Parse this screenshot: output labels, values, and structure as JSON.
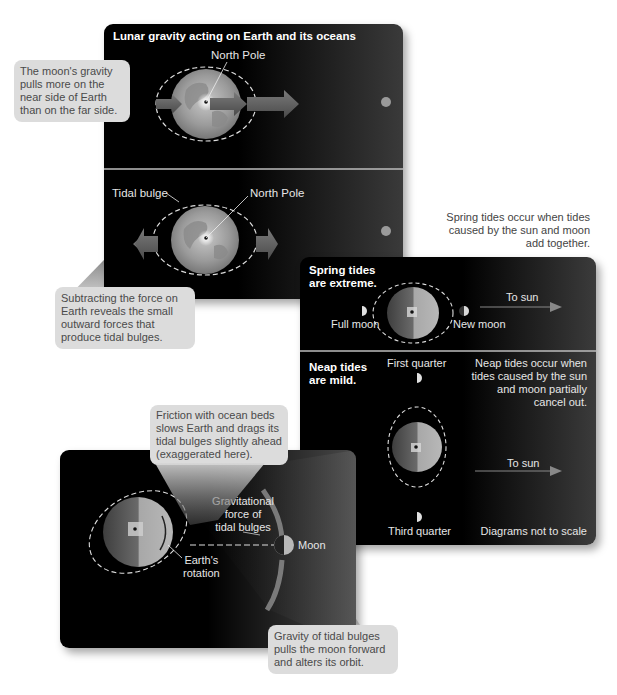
{
  "figure": {
    "top_panel": {
      "title": "Lunar gravity acting on Earth and its oceans",
      "upper": {
        "north_pole_label": "North Pole"
      },
      "lower": {
        "tidal_bulge_label": "Tidal bulge",
        "north_pole_label": "North Pole"
      }
    },
    "callouts": {
      "moon_gravity": [
        "The moon's gravity",
        "pulls more on the",
        "near side of Earth",
        "than on the far side."
      ],
      "subtracting": [
        "Subtracting the force on",
        "Earth reveals the small",
        "outward forces that",
        "produce tidal bulges."
      ],
      "friction": [
        "Friction with ocean beds",
        "slows Earth and drags its",
        "tidal bulges slightly ahead",
        "(exaggerated here)."
      ],
      "gravity_bulges": [
        "Gravity of tidal bulges",
        "pulls the moon forward",
        "and alters its orbit."
      ]
    },
    "spring_note": [
      "Spring tides occur when tides",
      "caused by the sun and moon",
      "add together."
    ],
    "tides_panel": {
      "spring": {
        "title": [
          "Spring tides",
          "are extreme."
        ],
        "full_moon": "Full moon",
        "new_moon": "New moon",
        "to_sun": "To sun"
      },
      "neap": {
        "title": [
          "Neap tides",
          "are mild."
        ],
        "first_quarter": "First quarter",
        "third_quarter": "Third quarter",
        "note": [
          "Neap tides occur when",
          "tides caused by the sun",
          "and moon partially",
          "cancel out."
        ],
        "to_sun": "To sun"
      },
      "scale_note": "Diagrams not to scale"
    },
    "friction_panel": {
      "grav_force_label": [
        "Gravitational",
        "force of",
        "tidal bulges"
      ],
      "moon_label": "Moon",
      "rotation_label": [
        "Earth's",
        "rotation"
      ]
    }
  }
}
